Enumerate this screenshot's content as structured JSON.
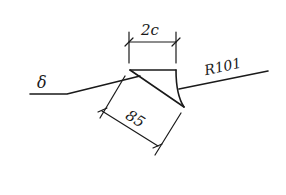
{
  "diagram": {
    "type": "weld-symbol-drawing",
    "labels": {
      "left_symbol": "δ",
      "top_dimension": "2c",
      "slant_dimension": "85",
      "right_reference": "R101"
    },
    "colors": {
      "stroke": "#1a1a1a",
      "background": "#ffffff"
    }
  }
}
